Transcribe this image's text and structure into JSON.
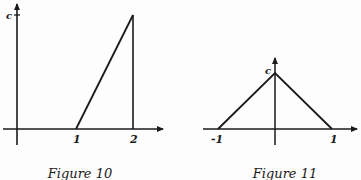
{
  "figures": [
    {
      "caption": "Figure 10",
      "y_label": "c",
      "x_ticks": [
        "1",
        "2"
      ],
      "shape": "right-triangle",
      "points": [
        [
          1,
          0
        ],
        [
          2,
          "c"
        ],
        [
          2,
          0
        ]
      ]
    },
    {
      "caption": "Figure 11",
      "y_label": "c",
      "x_ticks": [
        "-1",
        "1"
      ],
      "shape": "tent",
      "points": [
        [
          -1,
          0
        ],
        [
          0,
          "c"
        ],
        [
          1,
          0
        ]
      ]
    }
  ],
  "colors": {
    "ink": "#1a1a1a",
    "background": "#fdfdfd"
  }
}
